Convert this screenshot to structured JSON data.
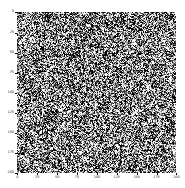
{
  "figure": {
    "background_color": "#ffffff",
    "has_title": false,
    "has_colorbar": false,
    "has_legend": false
  },
  "chart_data": {
    "type": "heatmap",
    "title": "",
    "subtitle": "",
    "xlabel": "",
    "ylabel": "",
    "colormap": "gray",
    "vmin": 0,
    "vmax": 255,
    "grid": false,
    "legend": "none",
    "origin": "upper",
    "interpolation": "nearest",
    "aspect": "equal",
    "data_shape": [
      200,
      200
    ],
    "xlim": [
      -0.5,
      199.5
    ],
    "ylim": [
      199.5,
      -0.5
    ],
    "x_ticks": [
      0,
      25,
      50,
      75,
      100,
      125,
      150,
      175,
      200
    ],
    "y_ticks": [
      0,
      25,
      50,
      75,
      100,
      125,
      150,
      175,
      200
    ],
    "x_ticklabels": [
      "0",
      "25",
      "50",
      "75",
      "100",
      "125",
      "150",
      "175",
      "200"
    ],
    "y_ticklabels": [
      "0",
      "25",
      "50",
      "75",
      "100",
      "125",
      "150",
      "175",
      "200"
    ],
    "annotations": [],
    "noise": {
      "distribution": "uniform",
      "mean_intensity": 128,
      "min_intensity": 0,
      "max_intensity": 255,
      "grain_pixels": 1,
      "seed": 1234
    }
  },
  "colors": {
    "axis_line": "#000000",
    "tick_label": "#262626",
    "canvas": "#ffffff",
    "noise_low": "#000000",
    "noise_high": "#ffffff"
  }
}
